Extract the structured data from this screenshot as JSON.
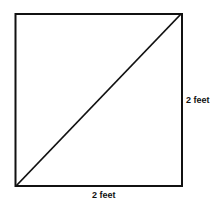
{
  "diagram": {
    "shape": "square",
    "has_diagonal": true,
    "diagonal": "bottom-left to top-right",
    "labels": {
      "right_side": "2 feet",
      "bottom_side": "2 feet"
    },
    "colors": {
      "stroke": "#111111",
      "background": "#ffffff"
    }
  }
}
